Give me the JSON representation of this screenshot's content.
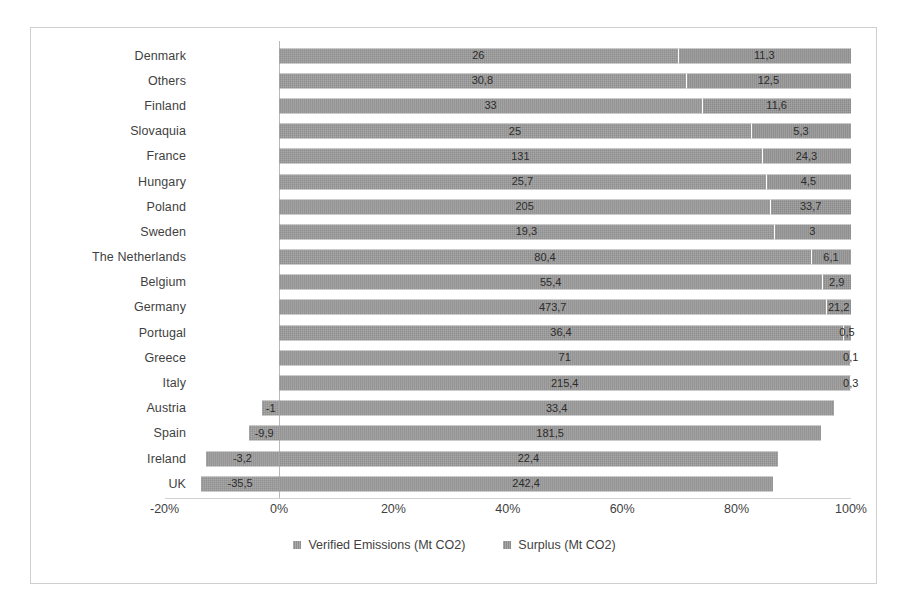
{
  "chart_data": {
    "type": "bar",
    "subtype": "stacked-horizontal-100-percent",
    "title": "",
    "subtitle": "",
    "xlabel": "",
    "ylabel": "",
    "grid": false,
    "legend_position": "bottom",
    "xlim": [
      -20,
      100
    ],
    "xticks": [
      "-20%",
      "0%",
      "20%",
      "40%",
      "60%",
      "80%",
      "100%"
    ],
    "xtick_values": [
      -20,
      0,
      20,
      40,
      60,
      80,
      100
    ],
    "categories": [
      "Denmark",
      "Others",
      "Finland",
      "Slovaquia",
      "France",
      "Hungary",
      "Poland",
      "Sweden",
      "The Netherlands",
      "Belgium",
      "Germany",
      "Portugal",
      "Greece",
      "Italy",
      "Austria",
      "Spain",
      "Ireland",
      "UK"
    ],
    "series": [
      {
        "name": "Verified Emissions (Mt CO2)",
        "color": "#8e8e8e",
        "values": [
          26,
          30.8,
          33,
          25,
          131,
          25.7,
          205,
          19.3,
          80.4,
          55.4,
          473.7,
          36.4,
          71,
          215.4,
          33.4,
          181.5,
          22.4,
          242.4
        ]
      },
      {
        "name": "Surplus (Mt CO2)",
        "color": "#8a8a8a",
        "values": [
          11.3,
          12.5,
          11.6,
          5.3,
          24.3,
          4.5,
          33.7,
          3,
          6.1,
          2.9,
          21.2,
          0.5,
          0.1,
          0.3,
          -1,
          -9.9,
          -3.2,
          -35.5
        ]
      }
    ],
    "rows": [
      {
        "category": "Denmark",
        "emissions": 26,
        "surplus": 11.3,
        "emissions_label": "26",
        "surplus_label": "11,3",
        "emissions_pct": 69.7,
        "surplus_pct": 30.3,
        "neg_pct": 0
      },
      {
        "category": "Others",
        "emissions": 30.8,
        "surplus": 12.5,
        "emissions_label": "30,8",
        "surplus_label": "12,5",
        "emissions_pct": 71.1,
        "surplus_pct": 28.9,
        "neg_pct": 0
      },
      {
        "category": "Finland",
        "emissions": 33,
        "surplus": 11.6,
        "emissions_label": "33",
        "surplus_label": "11,6",
        "emissions_pct": 74.0,
        "surplus_pct": 26.0,
        "neg_pct": 0
      },
      {
        "category": "Slovaquia",
        "emissions": 25,
        "surplus": 5.3,
        "emissions_label": "25",
        "surplus_label": "5,3",
        "emissions_pct": 82.5,
        "surplus_pct": 17.5,
        "neg_pct": 0
      },
      {
        "category": "France",
        "emissions": 131,
        "surplus": 24.3,
        "emissions_label": "131",
        "surplus_label": "24,3",
        "emissions_pct": 84.4,
        "surplus_pct": 15.6,
        "neg_pct": 0
      },
      {
        "category": "Hungary",
        "emissions": 25.7,
        "surplus": 4.5,
        "emissions_label": "25,7",
        "surplus_label": "4,5",
        "emissions_pct": 85.1,
        "surplus_pct": 14.9,
        "neg_pct": 0
      },
      {
        "category": "Poland",
        "emissions": 205,
        "surplus": 33.7,
        "emissions_label": "205",
        "surplus_label": "33,7",
        "emissions_pct": 85.9,
        "surplus_pct": 14.1,
        "neg_pct": 0
      },
      {
        "category": "Sweden",
        "emissions": 19.3,
        "surplus": 3,
        "emissions_label": "19,3",
        "surplus_label": "3",
        "emissions_pct": 86.5,
        "surplus_pct": 13.5,
        "neg_pct": 0
      },
      {
        "category": "The Netherlands",
        "emissions": 80.4,
        "surplus": 6.1,
        "emissions_label": "80,4",
        "surplus_label": "6,1",
        "emissions_pct": 93.0,
        "surplus_pct": 7.0,
        "neg_pct": 0
      },
      {
        "category": "Belgium",
        "emissions": 55.4,
        "surplus": 2.9,
        "emissions_label": "55,4",
        "surplus_label": "2,9",
        "emissions_pct": 95.0,
        "surplus_pct": 5.0,
        "neg_pct": 0
      },
      {
        "category": "Germany",
        "emissions": 473.7,
        "surplus": 21.2,
        "emissions_label": "473,7",
        "surplus_label": "21,2",
        "emissions_pct": 95.7,
        "surplus_pct": 4.3,
        "neg_pct": 0
      },
      {
        "category": "Portugal",
        "emissions": 36.4,
        "surplus": 0.5,
        "emissions_label": "36,4",
        "surplus_label": "0,5",
        "emissions_pct": 98.6,
        "surplus_pct": 1.4,
        "neg_pct": 0
      },
      {
        "category": "Greece",
        "emissions": 71,
        "surplus": 0.1,
        "emissions_label": "71",
        "surplus_label": "0,1",
        "emissions_pct": 99.9,
        "surplus_pct": 0.1,
        "neg_pct": 0
      },
      {
        "category": "Italy",
        "emissions": 215.4,
        "surplus": 0.3,
        "emissions_label": "215,4",
        "surplus_label": "0,3",
        "emissions_pct": 99.9,
        "surplus_pct": 0.1,
        "neg_pct": 0
      },
      {
        "category": "Austria",
        "emissions": 33.4,
        "surplus": -1,
        "emissions_label": "33,4",
        "surplus_label": "-1",
        "emissions_pct": 97.1,
        "surplus_pct": 0,
        "neg_pct": 2.9
      },
      {
        "category": "Spain",
        "emissions": 181.5,
        "surplus": -9.9,
        "emissions_label": "181,5",
        "surplus_label": "-9,9",
        "emissions_pct": 94.8,
        "surplus_pct": 0,
        "neg_pct": 5.2
      },
      {
        "category": "Ireland",
        "emissions": 22.4,
        "surplus": -3.2,
        "emissions_label": "22,4",
        "surplus_label": "-3,2",
        "emissions_pct": 87.2,
        "surplus_pct": 0,
        "neg_pct": 12.8
      },
      {
        "category": "UK",
        "emissions": 242.4,
        "surplus": -35.5,
        "emissions_label": "242,4",
        "surplus_label": "-35,5",
        "emissions_pct": 86.4,
        "surplus_pct": 0,
        "neg_pct": 13.6
      }
    ]
  },
  "legend": {
    "items": [
      {
        "label": "Verified Emissions (Mt CO2)"
      },
      {
        "label": "Surplus (Mt CO2)"
      }
    ]
  }
}
